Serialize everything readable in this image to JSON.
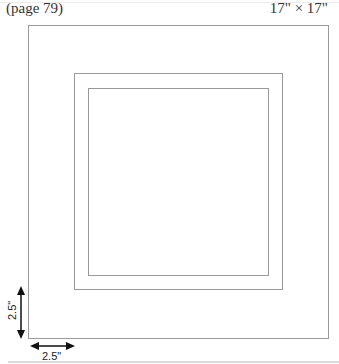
{
  "header": {
    "page_reference": "(page 79)",
    "dimensions": "17\" × 17\""
  },
  "diagram": {
    "rectangles": [
      {
        "name": "outer",
        "left": 28,
        "top": 25,
        "right": 328,
        "bottom": 338
      },
      {
        "name": "middle",
        "left": 74,
        "top": 73,
        "right": 282,
        "bottom": 289
      },
      {
        "name": "inner",
        "left": 88,
        "top": 88,
        "right": 268,
        "bottom": 275
      }
    ],
    "dimension_vertical": {
      "label": "2.5\""
    },
    "dimension_horizontal": {
      "label": "2.5\""
    },
    "line_color": "#9a9a9a",
    "arrow_color": "#111111"
  }
}
